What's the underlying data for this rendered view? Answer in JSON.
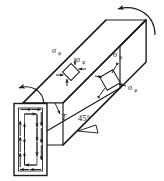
{
  "figure": {
    "line_color": "#1a1a1a",
    "fill_color": "#ffffff",
    "background": "#ffffff"
  },
  "labels": {
    "torque": "T",
    "angle": "45°",
    "sigma_symbol": "σ",
    "subscript": "φ",
    "element_left": {
      "upper_label": "σ",
      "upper_sub": "φ",
      "lower_label": "σ",
      "lower_sub": "φ"
    },
    "element_right": {
      "upper_label": "σ",
      "upper_sub": "φ",
      "lower_label": "σ",
      "lower_sub": "φ"
    }
  },
  "annotations": {
    "stress_elements": 2,
    "shear_flow_arrows": "circulating",
    "torque_arrows": 2
  }
}
